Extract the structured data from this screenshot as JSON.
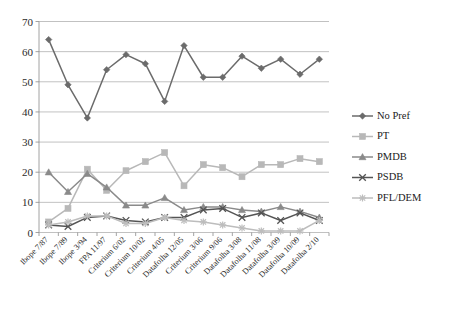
{
  "chart_data": {
    "type": "line",
    "title": "",
    "subtitle": "",
    "xlabel": "",
    "ylabel": "",
    "ylim": [
      0,
      70
    ],
    "ytick_values": [
      0,
      10,
      20,
      30,
      40,
      50,
      60,
      70
    ],
    "grid": "horizontal",
    "legend_position": "right",
    "categories": [
      "Ibope 7/87",
      "Ibope 7/89",
      "Ibope 3/94",
      "FPA 11/97",
      "Criterium 6/02",
      "Criterium 10/02",
      "Criterium 4/05",
      "Datafolha 12/05",
      "Criterium 3/06",
      "Criterium 9/06",
      "Datafolha 3/08",
      "Datafolha 11/08",
      "Datafolha 3/09",
      "Datafolha 10/09",
      "Datafolha 2/10"
    ],
    "series": [
      {
        "name": "No Pref",
        "color": "#6b6b6b",
        "marker": "diamond",
        "values": [
          64,
          49,
          38,
          54,
          59,
          56,
          43.5,
          62,
          51.5,
          51.5,
          58.5,
          54.5,
          57.5,
          52.5,
          57.5
        ]
      },
      {
        "name": "PT",
        "color": "#b8b8b8",
        "marker": "square",
        "values": [
          3.5,
          8,
          21,
          14,
          20.5,
          23.5,
          26.5,
          15.5,
          22.5,
          21.5,
          18.5,
          22.5,
          22.5,
          24.5,
          23.5
        ]
      },
      {
        "name": "PMDB",
        "color": "#8a8a8a",
        "marker": "triangle",
        "values": [
          20,
          13.5,
          19.5,
          15,
          9,
          9,
          11.5,
          7.5,
          8.5,
          8.5,
          7.5,
          7,
          8.5,
          7,
          5
        ]
      },
      {
        "name": "PSDB",
        "color": "#545454",
        "marker": "cross",
        "values": [
          2.5,
          2,
          5,
          5.5,
          4,
          3.5,
          5,
          5,
          7.5,
          8,
          5,
          6.5,
          4,
          6.5,
          4
        ]
      },
      {
        "name": "PFL/DEM",
        "color": "#bdbdbd",
        "marker": "star",
        "values": [
          2.5,
          3.5,
          5.5,
          5.5,
          3,
          3,
          5,
          4,
          3.5,
          2.5,
          1.5,
          0.5,
          0.5,
          0.5,
          4
        ]
      }
    ]
  }
}
